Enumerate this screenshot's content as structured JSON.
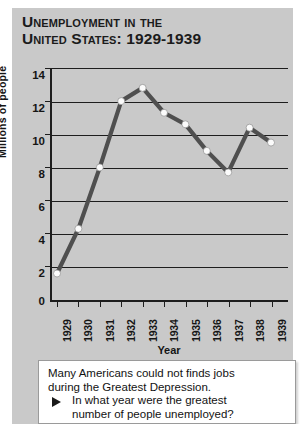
{
  "chart_data": {
    "type": "line",
    "title": "Unemployment in the United States: 1929-1939",
    "title_line1": "Unemployment in the",
    "title_line2": "United States: 1929-1939",
    "xlabel": "Year",
    "ylabel": "Millions of people",
    "categories": [
      "1929",
      "1930",
      "1931",
      "1932",
      "1933",
      "1934",
      "1935",
      "1936",
      "1937",
      "1938",
      "1939"
    ],
    "values": [
      1.6,
      4.3,
      8.0,
      12.0,
      12.8,
      11.3,
      10.6,
      9.0,
      7.7,
      10.4,
      9.5
    ],
    "series": [
      {
        "name": "Millions of people unemployed",
        "values": [
          1.6,
          4.3,
          8.0,
          12.0,
          12.8,
          11.3,
          10.6,
          9.0,
          7.7,
          10.4,
          9.5
        ]
      }
    ],
    "ylim": [
      0,
      14
    ],
    "yticks": [
      0,
      2,
      4,
      6,
      8,
      10,
      12,
      14
    ],
    "ytick_labels": [
      "0",
      "2",
      "4",
      "6",
      "8",
      "10",
      "12",
      "14"
    ],
    "grid": "horizontal",
    "legend": "none",
    "line_color": "#4f4f4f",
    "marker_color": "#fbfbfb",
    "panel_color": "#c9c9c9",
    "axis_color": "#1d1d1d"
  },
  "caption": {
    "line1": "Many Americans could not finds jobs",
    "line2": "during the Greatest Depression.",
    "bullet_icon": "triangle-right-icon",
    "question_line1": "In what year were the greatest",
    "question_line2": "number of people unemployed?"
  }
}
